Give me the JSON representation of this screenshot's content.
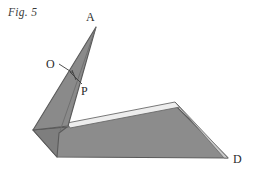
{
  "figure": {
    "caption": "Fig. 5",
    "labels": {
      "apex": "A",
      "origin": "O",
      "point_p": "P",
      "point_d": "D"
    },
    "colors": {
      "fill_main": "#8c8c8c",
      "fill_shade": "#7e7e7e",
      "fill_light": "#f0f0f0",
      "stroke": "#5a5a5a",
      "text": "#2b2b2b",
      "caption_text": "#3a3a3a",
      "background": "#ffffff"
    },
    "geometry": {
      "apex_A": [
        96,
        27
      ],
      "point_D": [
        228,
        158
      ],
      "fold_left_tip": [
        33,
        130
      ],
      "fold_bottom_left": [
        57,
        157
      ],
      "ridge_peak": [
        175,
        103
      ],
      "spike_base_right": [
        67,
        126
      ],
      "note": "folded paper figure: narrow triangular flap from A down to left fold, large quadrilateral flap to D"
    }
  }
}
